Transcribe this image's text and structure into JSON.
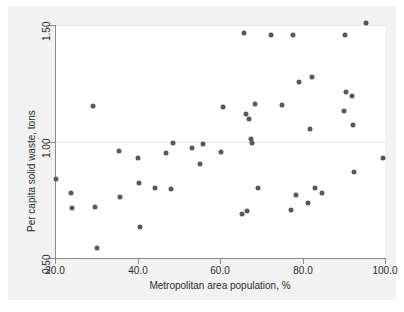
{
  "chart_data": {
    "type": "scatter",
    "title": "",
    "xlabel": "Metropolitan area population, %",
    "ylabel": "Per capita solid waste, tons",
    "xlim": [
      20.0,
      100.0
    ],
    "ylim": [
      0.5,
      1.5
    ],
    "xticks": [
      20.0,
      40.0,
      60.0,
      80.0,
      100.0
    ],
    "xtick_labels": [
      "20.0",
      "40.0",
      "60.0",
      "80.0",
      "100.0"
    ],
    "yticks": [
      0.5,
      1.0,
      1.5
    ],
    "ytick_labels": [
      "0.50",
      "1.00",
      "1.50"
    ],
    "grid": "horizontal",
    "legend": null,
    "marker_color": "#58585c",
    "panel_color": "#ffffff",
    "plate_color": "#f2f2f2",
    "gridline_color": "#e3e3e3",
    "axis_color": "#8c8c8c",
    "points": [
      {
        "x": 20.2,
        "y": 0.838
      },
      {
        "x": 23.8,
        "y": 0.778
      },
      {
        "x": 24.2,
        "y": 0.714
      },
      {
        "x": 29.2,
        "y": 1.153
      },
      {
        "x": 29.6,
        "y": 0.718
      },
      {
        "x": 30.1,
        "y": 0.541
      },
      {
        "x": 35.5,
        "y": 0.96
      },
      {
        "x": 35.8,
        "y": 0.76
      },
      {
        "x": 40.2,
        "y": 0.929
      },
      {
        "x": 40.3,
        "y": 0.82
      },
      {
        "x": 40.5,
        "y": 0.634
      },
      {
        "x": 44.3,
        "y": 0.8
      },
      {
        "x": 46.9,
        "y": 0.953
      },
      {
        "x": 48.0,
        "y": 0.795
      },
      {
        "x": 48.5,
        "y": 0.992
      },
      {
        "x": 53.3,
        "y": 0.971
      },
      {
        "x": 55.1,
        "y": 0.904
      },
      {
        "x": 55.9,
        "y": 0.991
      },
      {
        "x": 60.3,
        "y": 0.955
      },
      {
        "x": 60.8,
        "y": 1.148
      },
      {
        "x": 65.3,
        "y": 0.689
      },
      {
        "x": 65.8,
        "y": 1.466
      },
      {
        "x": 66.2,
        "y": 1.118
      },
      {
        "x": 66.6,
        "y": 0.703
      },
      {
        "x": 67.1,
        "y": 1.096
      },
      {
        "x": 67.5,
        "y": 1.013
      },
      {
        "x": 67.7,
        "y": 0.995
      },
      {
        "x": 68.4,
        "y": 1.16
      },
      {
        "x": 69.2,
        "y": 0.8
      },
      {
        "x": 72.4,
        "y": 1.457
      },
      {
        "x": 75.1,
        "y": 1.155
      },
      {
        "x": 77.3,
        "y": 0.705
      },
      {
        "x": 77.8,
        "y": 1.457
      },
      {
        "x": 78.5,
        "y": 0.769
      },
      {
        "x": 79.1,
        "y": 1.255
      },
      {
        "x": 81.2,
        "y": 0.737
      },
      {
        "x": 81.8,
        "y": 1.054
      },
      {
        "x": 82.4,
        "y": 1.277
      },
      {
        "x": 83.0,
        "y": 0.8
      },
      {
        "x": 84.7,
        "y": 0.779
      },
      {
        "x": 90.1,
        "y": 1.13
      },
      {
        "x": 90.4,
        "y": 1.457
      },
      {
        "x": 90.6,
        "y": 1.214
      },
      {
        "x": 91.9,
        "y": 1.197
      },
      {
        "x": 92.2,
        "y": 1.073
      },
      {
        "x": 92.4,
        "y": 0.87
      },
      {
        "x": 95.3,
        "y": 1.51
      },
      {
        "x": 99.4,
        "y": 0.93
      }
    ]
  }
}
